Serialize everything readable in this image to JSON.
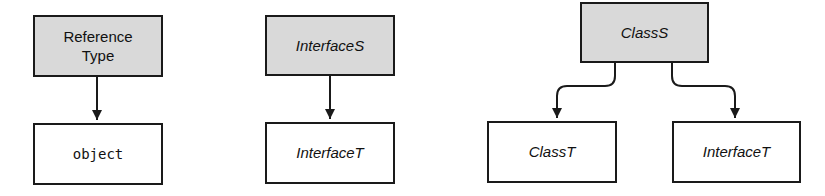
{
  "diagrams": [
    {
      "name": "reference-type-conversion",
      "source": {
        "label": "Reference Type",
        "label_lines": [
          "Reference",
          "Type"
        ],
        "style": "shaded"
      },
      "targets": [
        {
          "label": "object",
          "style": "plain",
          "font": "monospace"
        }
      ]
    },
    {
      "name": "interface-conversion",
      "source": {
        "label": "InterfaceS",
        "style": "shaded",
        "font": "italic"
      },
      "targets": [
        {
          "label": "InterfaceT",
          "style": "plain",
          "font": "italic"
        }
      ]
    },
    {
      "name": "class-conversion",
      "source": {
        "label": "ClassS",
        "style": "shaded",
        "font": "italic"
      },
      "targets": [
        {
          "label": "ClassT",
          "style": "plain",
          "font": "italic"
        },
        {
          "label": "InterfaceT",
          "style": "plain",
          "font": "italic"
        }
      ]
    }
  ],
  "colors": {
    "shaded_fill": "#d9d9d9",
    "stroke": "#1a1a1a",
    "background": "#ffffff"
  }
}
